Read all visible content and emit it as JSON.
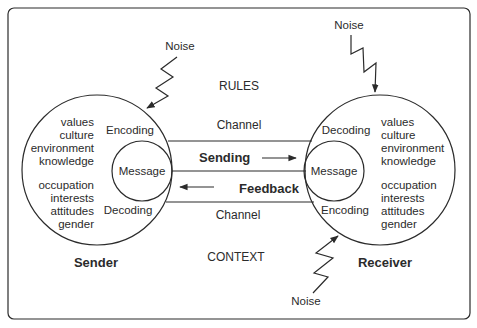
{
  "diagram": {
    "type": "communication-model",
    "top_label": "RULES",
    "bottom_label": "CONTEXT",
    "channel": {
      "top_label": "Channel",
      "bottom_label": "Channel",
      "sending_label": "Sending",
      "feedback_label": "Feedback"
    },
    "sender": {
      "title": "Sender",
      "encoding_label": "Encoding",
      "decoding_label": "Decoding",
      "message_label": "Message",
      "attributes_top": [
        "values",
        "culture",
        "environment",
        "knowledge"
      ],
      "attributes_bottom": [
        "occupation",
        "interests",
        "attitudes",
        "gender"
      ]
    },
    "receiver": {
      "title": "Receiver",
      "decoding_label": "Decoding",
      "encoding_label": "Encoding",
      "message_label": "Message",
      "attributes_top": [
        "values",
        "culture",
        "environment",
        "knowledge"
      ],
      "attributes_bottom": [
        "occupation",
        "interests",
        "attitudes",
        "gender"
      ]
    },
    "noise": [
      {
        "label": "Noise",
        "target": "sender"
      },
      {
        "label": "Noise",
        "target": "receiver-top"
      },
      {
        "label": "Noise",
        "target": "receiver-bottom"
      }
    ],
    "colors": {
      "line": "#2b2b2b",
      "background": "#ffffff"
    }
  }
}
